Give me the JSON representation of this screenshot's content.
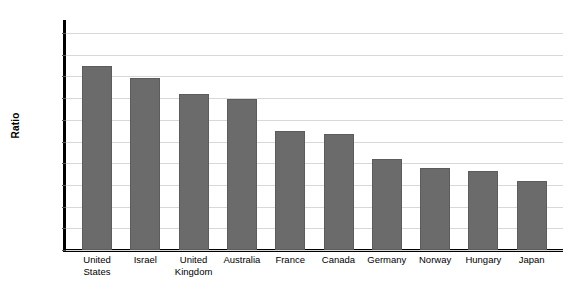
{
  "chart_data": {
    "type": "bar",
    "title": "",
    "xlabel": "",
    "ylabel": "Ratio",
    "ylim": [
      0,
      10
    ],
    "ytick_step": 1,
    "grid": true,
    "legend": "none",
    "bar_color": "#6b6b6b",
    "axis_color": "#000000",
    "gridline_color": "#d8d8d8",
    "categories": [
      "United States",
      "Israel",
      "United Kingdom",
      "Australia",
      "France",
      "Canada",
      "Germany",
      "Norway",
      "Hungary",
      "Japan"
    ],
    "values": [
      8.48,
      7.93,
      7.19,
      6.96,
      5.48,
      5.35,
      4.19,
      3.78,
      3.64,
      3.18
    ],
    "ytick_labels": [
      "0.00",
      "1.00",
      "2.00",
      "3.00",
      "4.00",
      "5.00",
      "6.00",
      "7.00",
      "8.00",
      "9.00",
      "10.00"
    ],
    "xtick_labels": [
      "United\nStates",
      "Israel",
      "United\nKingdom",
      "Australia",
      "France",
      "Canada",
      "Germany",
      "Norway",
      "Hungary",
      "Japan"
    ]
  }
}
